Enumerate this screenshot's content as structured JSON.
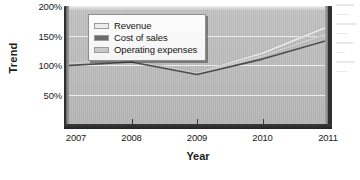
{
  "chart_data": {
    "type": "line",
    "title": "",
    "xlabel": "Year",
    "ylabel": "Trend",
    "categories": [
      "2007",
      "2008",
      "2009",
      "2010",
      "2011"
    ],
    "x": [
      2007,
      2008,
      2009,
      2010,
      2011
    ],
    "xlim": [
      2007,
      2011
    ],
    "ylim": [
      0,
      200
    ],
    "yticks": [
      50,
      100,
      150,
      200
    ],
    "ytick_labels": [
      "50%",
      "100%",
      "150%",
      "200%"
    ],
    "grid": true,
    "legend_position": "top-left-inside",
    "series": [
      {
        "name": "Revenue",
        "color": "#e8e8e8",
        "values": [
          103,
          107,
          86,
          120,
          165
        ]
      },
      {
        "name": "Cost of sales",
        "color": "#4a4a4a",
        "values": [
          99,
          105,
          84,
          110,
          142
        ]
      },
      {
        "name": "Operating expenses",
        "color": "#d0d0d0",
        "values": [
          101,
          106,
          85,
          115,
          153
        ]
      }
    ]
  },
  "axis": {
    "y_title": "Trend",
    "x_title": "Year",
    "y_tick_labels": [
      "200%",
      "150%",
      "100%",
      "50%"
    ],
    "x_tick_labels": [
      "2007",
      "2008",
      "2009",
      "2010",
      "2011"
    ]
  },
  "legend": {
    "items": [
      {
        "label": "Revenue",
        "swatch": "#ededed"
      },
      {
        "label": "Cost of sales",
        "swatch": "#6b6b6b"
      },
      {
        "label": "Operating expenses",
        "swatch": "#c9c9c9"
      }
    ]
  },
  "colors": {
    "plot_background": "#bdbdbd",
    "gridline": "#f2f2f2",
    "axis": "#2a2a2a",
    "text": "#1a1a1a"
  }
}
